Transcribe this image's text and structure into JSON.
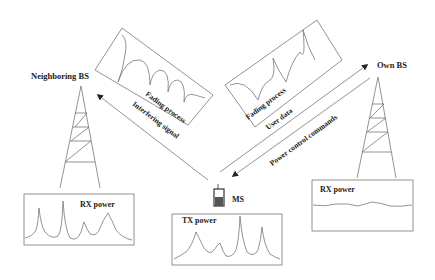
{
  "nodes": {
    "neighboring_bs": {
      "label": "Neighboring BS"
    },
    "own_bs": {
      "label": "Own BS"
    },
    "ms": {
      "label": "MS"
    }
  },
  "links": {
    "interfering_signal": {
      "label": "Interfering signal"
    },
    "user_data": {
      "label": "User data"
    },
    "power_control": {
      "label": "Power control commands"
    }
  },
  "panels": {
    "fading_left": {
      "label": "Fading process"
    },
    "fading_right": {
      "label": "Fading process"
    },
    "rx_neighbor": {
      "label": "RX power"
    },
    "tx_ms": {
      "label": "TX power"
    },
    "rx_own": {
      "label": "RX power"
    }
  },
  "colors": {
    "line": "#777777",
    "text": "#222222",
    "phone": "#333333"
  }
}
